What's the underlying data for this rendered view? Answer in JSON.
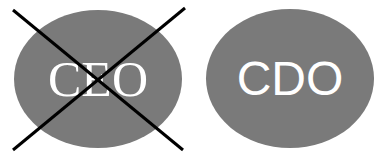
{
  "left": {
    "label": "CEO",
    "crossed_out": true,
    "fill": "#7a7a7a"
  },
  "right": {
    "label": "CDO",
    "crossed_out": false,
    "fill": "#7a7a7a"
  },
  "cross": {
    "color": "#000000"
  }
}
